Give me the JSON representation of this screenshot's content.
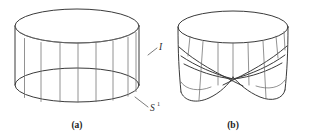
{
  "figure": {
    "kind": "mathematical-diagram",
    "background_color": "#ffffff",
    "line_color": "#5b5b5b",
    "label_color": "#2b2b2b",
    "panels": [
      {
        "id": "panel-a",
        "caption": "(a)",
        "object": "cylinder",
        "fiber_count": 8
      },
      {
        "id": "panel-b",
        "caption": "(b)",
        "object": "twisted-band",
        "fiber_count": 8
      }
    ],
    "annotations": [
      {
        "id": "fiber-label",
        "text": "I",
        "superscript": "",
        "target": "vertical fiber of cylinder"
      },
      {
        "id": "base-circle-label",
        "text": "S",
        "superscript": "1",
        "target": "bottom boundary circle of cylinder"
      }
    ]
  }
}
